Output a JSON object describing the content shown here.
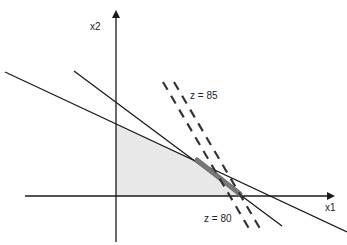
{
  "axes": {
    "x_label": "x1",
    "y_label": "x2"
  },
  "objective_lines": [
    {
      "label": "z = 85",
      "style": "dashed"
    },
    {
      "label": "z = 80",
      "style": "dashed"
    }
  ],
  "constraints": [
    {
      "name": "constraint-1",
      "style": "solid"
    },
    {
      "name": "constraint-2",
      "style": "solid"
    }
  ],
  "feasible_region": {
    "fill": "#e8e8e8"
  },
  "optimal_segment": {
    "color": "#777777"
  },
  "colors": {
    "line": "#1a1a1a",
    "region": "#e8e8e8",
    "optimal": "#777777"
  }
}
